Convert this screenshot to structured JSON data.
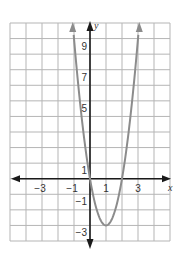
{
  "chart_data": {
    "type": "line",
    "title": "",
    "xlabel": "x",
    "ylabel": "y",
    "xlim": [
      -5,
      5
    ],
    "ylim": [
      -4,
      10
    ],
    "grid": true,
    "x_ticks": [
      -3,
      -1,
      1,
      3
    ],
    "x_tick_labels": [
      "−3",
      "−1",
      "1",
      "3"
    ],
    "y_ticks": [
      9,
      7,
      5,
      1,
      -1,
      -3
    ],
    "y_tick_labels": [
      "9",
      "7",
      "5",
      "1",
      "−1",
      "−3"
    ],
    "series": [
      {
        "name": "parabola",
        "equation": "y = 3x^2 - 6x",
        "vertex": [
          1,
          -3
        ],
        "x_intercepts": [
          0,
          2
        ],
        "x": [
          -1.08,
          -1,
          -0.5,
          0,
          0.5,
          1,
          1.5,
          2,
          2.5,
          3,
          3.08
        ],
        "y": [
          10,
          9,
          3.75,
          0,
          -2.25,
          -3,
          -2.25,
          0,
          3.75,
          9,
          10
        ],
        "color": "#8c8c8c",
        "arrows_at_ends": true
      }
    ],
    "colors": {
      "grid": "#b5b5b5",
      "axes": "#1a1a1a",
      "curve": "#8c8c8c"
    }
  }
}
